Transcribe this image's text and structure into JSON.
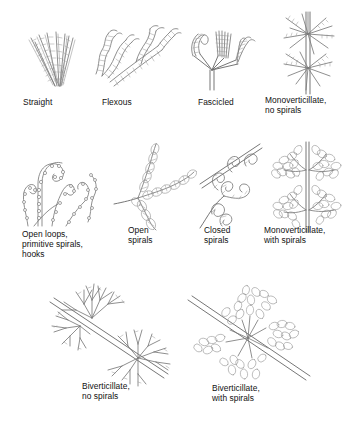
{
  "figure": {
    "background_color": "#ffffff",
    "ink_color": "#7b7b7b",
    "label_color": "#111111"
  },
  "panels": [
    {
      "id": "straight",
      "label": "Straight",
      "row": 1,
      "art": "fan-of-straight-beaded-filaments"
    },
    {
      "id": "flexous",
      "label": "Flexous",
      "row": 1,
      "art": "wavy-branching-segmented-filaments"
    },
    {
      "id": "fascicled",
      "label": "Fascicled",
      "row": 1,
      "art": "bundled-filaments-on-branching-stalks"
    },
    {
      "id": "monoverticillate-no-spirals",
      "label": "Monoverticillate,\nno spirals",
      "row": 1,
      "art": "two-whorls-of-straight-rays-on-vertical-stem"
    },
    {
      "id": "open-loops",
      "label": "Open loops,\nprimitive spirals,\nhooks",
      "row": 2,
      "art": "beaded-loops-hooks-and-coil"
    },
    {
      "id": "open-spirals",
      "label": "Open\nspirals",
      "row": 2,
      "art": "loose-helical-coils-on-branches"
    },
    {
      "id": "closed-spirals",
      "label": "Closed\nspirals",
      "row": 2,
      "art": "tight-closed-coils-on-diagonal-stem"
    },
    {
      "id": "monoverticillate-with-spirals",
      "label": "Monoverticillate,\nwith spirals",
      "row": 2,
      "art": "two-coiled-whorls-on-vertical-stem"
    },
    {
      "id": "biverticillate-no-spirals",
      "label": "Biverticillate,\nno spirals",
      "row": 3,
      "art": "two-tier-branching-whorls-on-diagonal-stem"
    },
    {
      "id": "biverticillate-with-spirals",
      "label": "Biverticillate,\nwith spirals",
      "row": 3,
      "art": "two-tier-coiled-whorls-on-diagonal-stem"
    }
  ]
}
